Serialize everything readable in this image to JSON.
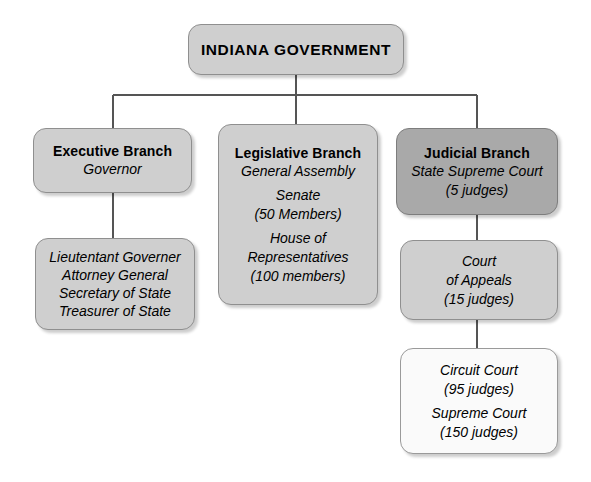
{
  "diagram": {
    "colors": {
      "box_default": "#cfcfcf",
      "box_highlight": "#a9a9a9",
      "box_light": "#fafafa",
      "border": "#8f8f8f",
      "connector": "#555555",
      "background": "#ffffff",
      "text": "#000000"
    }
  },
  "nodes": {
    "root": {
      "title": "INDIANA GOVERNMENT"
    },
    "executive": {
      "title": "Executive Branch",
      "lines": [
        "Governor"
      ]
    },
    "executive_officers": {
      "lines": [
        "Lieutentant Governer",
        "Attorney General",
        "Secretary of State",
        "Treasurer of State"
      ]
    },
    "legislative": {
      "title": "Legislative Branch",
      "lines": [
        "General Assembly",
        "Senate",
        "(50 Members)",
        "House of",
        "Representatives",
        "(100 members)"
      ]
    },
    "judicial": {
      "title": "Judicial Branch",
      "lines": [
        "State Supreme Court",
        "(5 judges)"
      ]
    },
    "court_of_appeals": {
      "lines": [
        "Court",
        "of Appeals",
        "(15 judges)"
      ]
    },
    "lower_courts": {
      "lines": [
        "Circuit Court",
        "(95 judges)",
        "Supreme Court",
        "(150 judges)"
      ]
    }
  }
}
